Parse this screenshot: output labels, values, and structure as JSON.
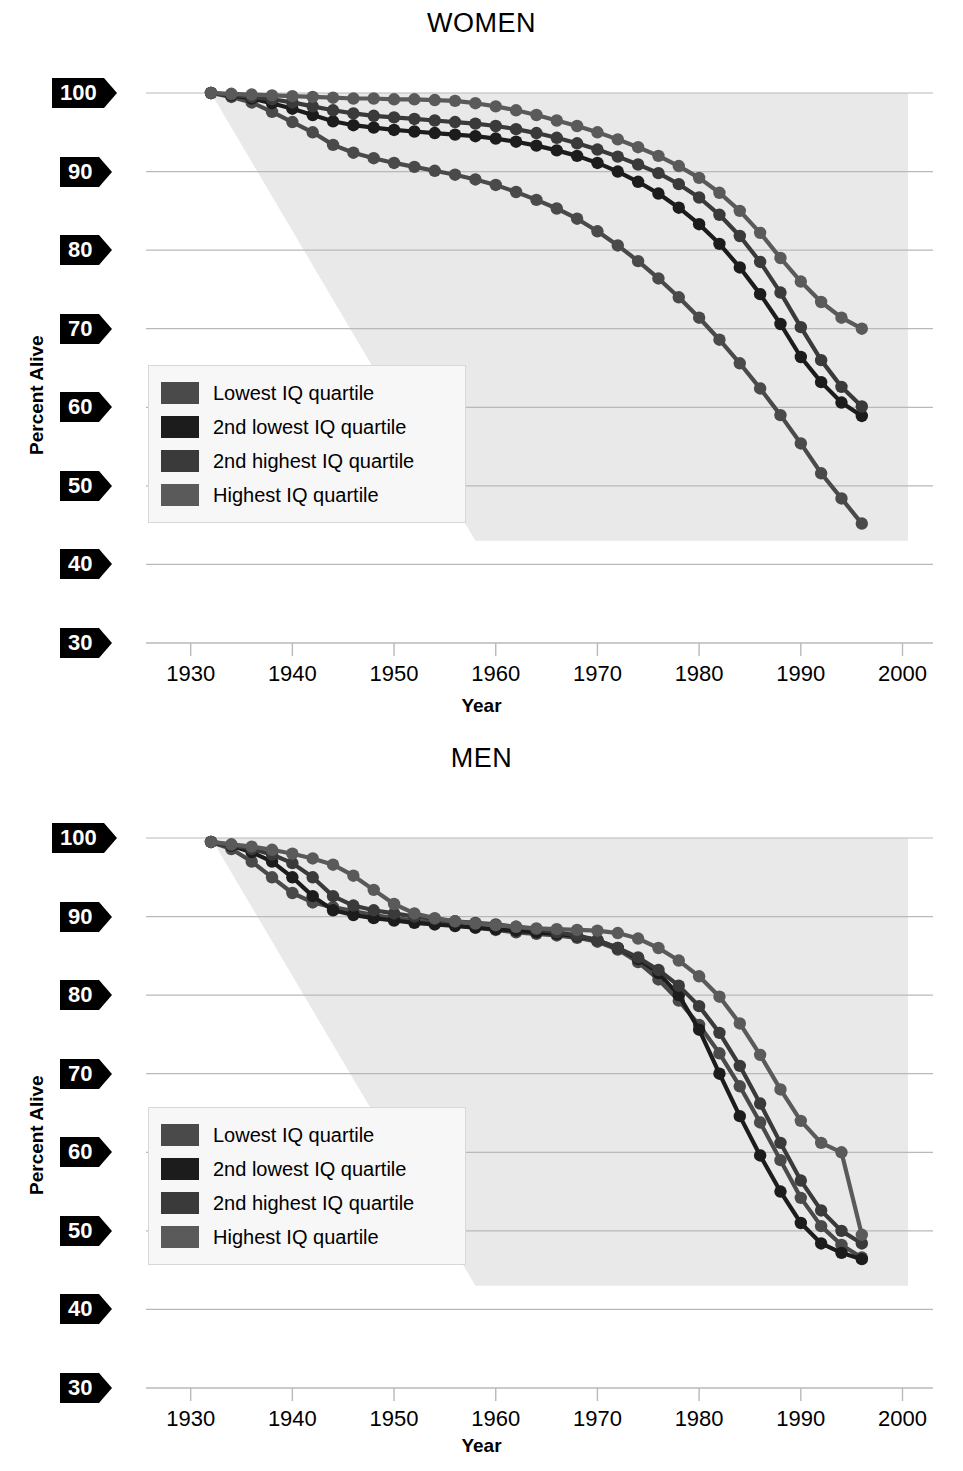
{
  "figure": {
    "y_axis_title": "Percent Alive",
    "x_axis_title": "Year",
    "y_ticks": [
      100,
      90,
      80,
      70,
      60,
      50,
      40,
      30
    ],
    "x_ticks": [
      1930,
      1940,
      1950,
      1960,
      1970,
      1980,
      1990,
      2000
    ],
    "ylim": [
      30,
      100
    ],
    "xlim": [
      1926,
      2003
    ],
    "grid": "horizontal",
    "legend_position": "inside-left-lower",
    "colors": {
      "lowest": "#4a4a4a",
      "second_lowest": "#1c1c1c",
      "second_highest": "#3a3a3a",
      "highest": "#5a5a5a",
      "gridline": "#b9b9b9",
      "shading": "#e9e9e9",
      "tag_background": "#000000",
      "tag_text": "#ffffff",
      "legend_background": "#f7f7f7",
      "legend_border": "#d8d8d8"
    }
  },
  "legend": {
    "items": [
      {
        "label": "Lowest IQ quartile",
        "color": "#4a4a4a",
        "key": "lowest"
      },
      {
        "label": "2nd lowest IQ quartile",
        "color": "#1c1c1c",
        "key": "second_lowest"
      },
      {
        "label": "2nd highest IQ quartile",
        "color": "#3a3a3a",
        "key": "second_highest"
      },
      {
        "label": "Highest IQ quartile",
        "color": "#5a5a5a",
        "key": "highest"
      }
    ]
  },
  "chart_data": [
    {
      "type": "line",
      "title": "WOMEN",
      "xlabel": "Year",
      "ylabel": "Percent Alive",
      "xlim": [
        1926,
        2003
      ],
      "ylim": [
        30,
        100
      ],
      "grid": true,
      "legend": [
        "Lowest IQ quartile",
        "2nd lowest IQ quartile",
        "2nd highest IQ quartile",
        "Highest IQ quartile"
      ],
      "x": [
        1932,
        1934,
        1936,
        1938,
        1940,
        1942,
        1944,
        1946,
        1948,
        1950,
        1952,
        1954,
        1956,
        1958,
        1960,
        1962,
        1964,
        1966,
        1968,
        1970,
        1972,
        1974,
        1976,
        1978,
        1980,
        1982,
        1984,
        1986,
        1988,
        1990,
        1992,
        1994,
        1996
      ],
      "series": [
        {
          "name": "Lowest IQ quartile",
          "color": "#4a4a4a",
          "values": [
            100.0,
            99.5,
            98.8,
            97.6,
            96.3,
            95.0,
            93.4,
            92.4,
            91.7,
            91.1,
            90.6,
            90.1,
            89.6,
            89.0,
            88.3,
            87.4,
            86.4,
            85.3,
            84.0,
            82.4,
            80.6,
            78.6,
            76.4,
            74.0,
            71.4,
            68.6,
            65.6,
            62.4,
            59.0,
            55.4,
            51.6,
            48.4,
            45.2
          ]
        },
        {
          "name": "2nd lowest IQ quartile",
          "color": "#1c1c1c",
          "values": [
            100.0,
            99.7,
            99.3,
            98.7,
            98.0,
            97.2,
            96.4,
            95.9,
            95.6,
            95.3,
            95.1,
            94.9,
            94.7,
            94.5,
            94.2,
            93.8,
            93.3,
            92.7,
            92.0,
            91.1,
            90.0,
            88.7,
            87.2,
            85.4,
            83.3,
            80.8,
            77.8,
            74.4,
            70.6,
            66.4,
            63.2,
            60.6,
            58.9
          ]
        },
        {
          "name": "2nd highest IQ quartile",
          "color": "#3a3a3a",
          "values": [
            100.0,
            99.8,
            99.5,
            99.2,
            98.8,
            98.3,
            97.8,
            97.4,
            97.1,
            96.9,
            96.7,
            96.5,
            96.3,
            96.1,
            95.8,
            95.4,
            94.9,
            94.3,
            93.6,
            92.8,
            91.9,
            90.9,
            89.8,
            88.4,
            86.7,
            84.5,
            81.8,
            78.5,
            74.6,
            70.2,
            66.0,
            62.6,
            60.1
          ]
        },
        {
          "name": "Highest IQ quartile",
          "color": "#5a5a5a",
          "values": [
            100.0,
            99.9,
            99.8,
            99.7,
            99.6,
            99.5,
            99.4,
            99.3,
            99.3,
            99.2,
            99.2,
            99.1,
            99.0,
            98.7,
            98.3,
            97.8,
            97.2,
            96.5,
            95.8,
            95.0,
            94.1,
            93.1,
            92.0,
            90.7,
            89.2,
            87.3,
            85.0,
            82.2,
            79.0,
            76.0,
            73.4,
            71.4,
            70.0
          ]
        }
      ]
    },
    {
      "type": "line",
      "title": "MEN",
      "xlabel": "Year",
      "ylabel": "Percent Alive",
      "xlim": [
        1926,
        2003
      ],
      "ylim": [
        30,
        100
      ],
      "grid": true,
      "legend": [
        "Lowest IQ quartile",
        "2nd lowest IQ quartile",
        "2nd highest IQ quartile",
        "Highest IQ quartile"
      ],
      "x": [
        1932,
        1934,
        1936,
        1938,
        1940,
        1942,
        1944,
        1946,
        1948,
        1950,
        1952,
        1954,
        1956,
        1958,
        1960,
        1962,
        1964,
        1966,
        1968,
        1970,
        1972,
        1974,
        1976,
        1978,
        1980,
        1982,
        1984,
        1986,
        1988,
        1990,
        1992,
        1994,
        1996
      ],
      "series": [
        {
          "name": "Lowest IQ quartile",
          "color": "#4a4a4a",
          "values": [
            99.5,
            98.6,
            97.0,
            95.0,
            93.0,
            91.8,
            91.2,
            90.7,
            90.2,
            89.8,
            89.5,
            89.2,
            88.9,
            88.6,
            88.3,
            88.0,
            87.8,
            87.6,
            87.3,
            86.8,
            85.8,
            84.2,
            82.0,
            79.3,
            76.2,
            72.6,
            68.4,
            63.8,
            59.0,
            54.2,
            50.6,
            48.2,
            46.6
          ]
        },
        {
          "name": "2nd lowest IQ quartile",
          "color": "#1c1c1c",
          "values": [
            99.5,
            99.0,
            98.2,
            97.0,
            95.0,
            92.6,
            90.8,
            90.2,
            89.8,
            89.5,
            89.2,
            89.0,
            88.8,
            88.6,
            88.4,
            88.2,
            88.0,
            87.8,
            87.5,
            87.0,
            86.0,
            84.6,
            82.8,
            80.0,
            75.6,
            70.0,
            64.6,
            59.6,
            55.0,
            51.0,
            48.4,
            47.2,
            46.4
          ]
        },
        {
          "name": "2nd highest IQ quartile",
          "color": "#3a3a3a",
          "values": [
            99.5,
            99.1,
            98.6,
            97.9,
            96.8,
            95.0,
            92.6,
            91.4,
            90.8,
            90.4,
            90.0,
            89.7,
            89.4,
            89.2,
            89.0,
            88.7,
            88.4,
            88.0,
            87.6,
            87.0,
            86.0,
            84.8,
            83.2,
            81.2,
            78.6,
            75.2,
            71.0,
            66.2,
            61.2,
            56.4,
            52.6,
            50.0,
            48.4
          ]
        },
        {
          "name": "Highest IQ quartile",
          "color": "#5a5a5a",
          "values": [
            99.5,
            99.2,
            98.9,
            98.5,
            98.0,
            97.4,
            96.6,
            95.2,
            93.4,
            91.6,
            90.4,
            89.8,
            89.4,
            89.1,
            88.9,
            88.7,
            88.5,
            88.4,
            88.3,
            88.2,
            87.9,
            87.2,
            86.0,
            84.4,
            82.4,
            79.8,
            76.4,
            72.4,
            68.0,
            64.0,
            61.2,
            60.0,
            49.5
          ]
        }
      ]
    }
  ]
}
